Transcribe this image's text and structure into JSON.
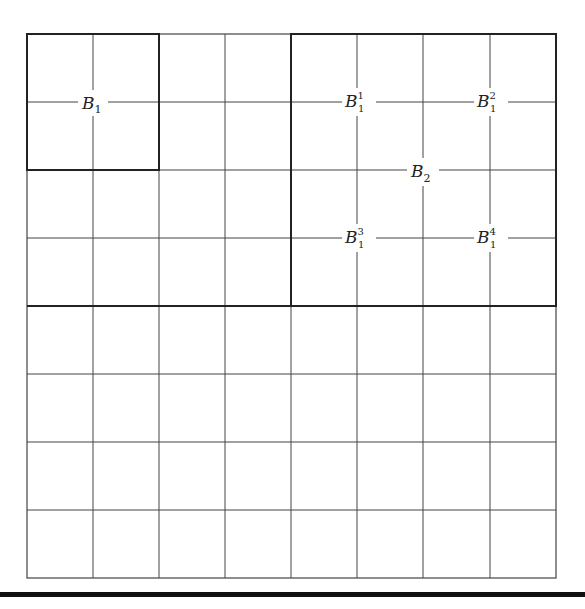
{
  "diagram": {
    "type": "grid-partition",
    "grid": {
      "rows": 8,
      "cols": 8
    },
    "blocks": [
      {
        "id": "B1",
        "label": "B",
        "sub": "1",
        "sup": "",
        "cells": "rows 0-1, cols 0-1",
        "thick_border": true
      },
      {
        "id": "B2",
        "label": "B",
        "sub": "2",
        "sup": "",
        "cells": "rows 0-3, cols 4-7",
        "thick_border": true
      },
      {
        "id": "B1^1",
        "label": "B",
        "sub": "1",
        "sup": "1",
        "cells": "rows 0-1, cols 4-5"
      },
      {
        "id": "B1^2",
        "label": "B",
        "sub": "1",
        "sup": "2",
        "cells": "rows 0-1, cols 6-7"
      },
      {
        "id": "B1^3",
        "label": "B",
        "sub": "1",
        "sup": "3",
        "cells": "rows 2-3, cols 4-5"
      },
      {
        "id": "B1^4",
        "label": "B",
        "sub": "1",
        "sup": "4",
        "cells": "rows 2-3, cols 6-7"
      }
    ],
    "line_color": "#333333",
    "background": "#ffffff"
  },
  "labels": {
    "b1": {
      "main": "B",
      "sub": "1"
    },
    "b2": {
      "main": "B",
      "sub": "2"
    },
    "b11": {
      "main": "B",
      "sub": "1",
      "sup": "1"
    },
    "b12": {
      "main": "B",
      "sub": "1",
      "sup": "2"
    },
    "b13": {
      "main": "B",
      "sub": "1",
      "sup": "3"
    },
    "b14": {
      "main": "B",
      "sub": "1",
      "sup": "4"
    }
  }
}
